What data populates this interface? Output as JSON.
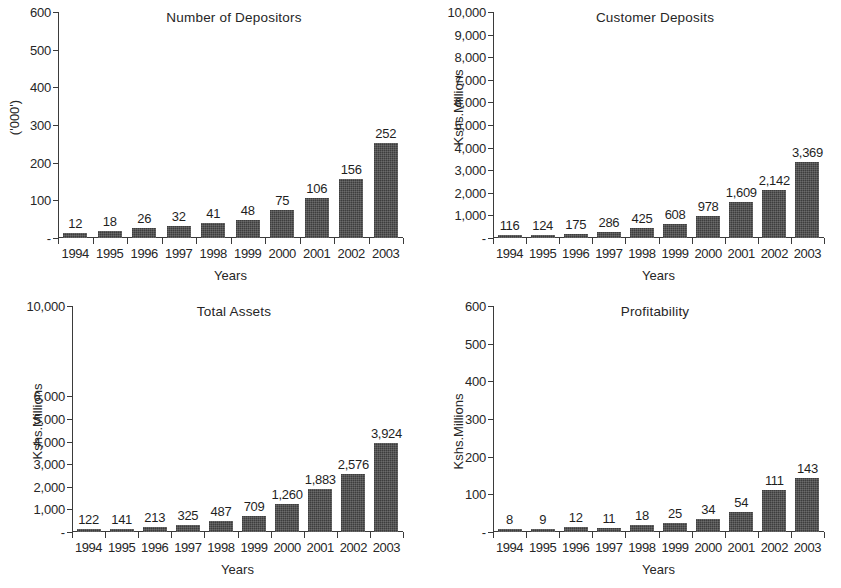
{
  "figure": {
    "background": "#ffffff",
    "bar_color": "#4a4a4a",
    "axis_color": "#3b3b3b",
    "panel_count": 4
  },
  "chart_data": [
    {
      "type": "bar",
      "title": "Number of Depositors",
      "xlabel": "Years",
      "ylabel": "('000')",
      "categories": [
        "1994",
        "1995",
        "1996",
        "1997",
        "1998",
        "1999",
        "2000",
        "2001",
        "2002",
        "2003"
      ],
      "values": [
        12,
        18,
        26,
        32,
        41,
        48,
        75,
        106,
        156,
        252
      ],
      "value_labels": [
        "12",
        "18",
        "26",
        "32",
        "41",
        "48",
        "75",
        "106",
        "156",
        "252"
      ],
      "ylim": [
        0,
        600
      ],
      "yticks": [
        0,
        100,
        200,
        300,
        400,
        500,
        600
      ],
      "ytick_labels": [
        "-",
        "100",
        "200",
        "300",
        "400",
        "500",
        "600"
      ],
      "grid": false,
      "legend": "none"
    },
    {
      "type": "bar",
      "title": "Customer Deposits",
      "xlabel": "Years",
      "ylabel": "Kshs.Millions",
      "categories": [
        "1994",
        "1995",
        "1996",
        "1997",
        "1998",
        "1999",
        "2000",
        "2001",
        "2002",
        "2003"
      ],
      "values": [
        116,
        124,
        175,
        286,
        425,
        608,
        978,
        1609,
        2142,
        3369
      ],
      "value_labels": [
        "116",
        "124",
        "175",
        "286",
        "425",
        "608",
        "978",
        "1,609",
        "2,142",
        "3,369"
      ],
      "ylim": [
        0,
        10000
      ],
      "yticks": [
        0,
        1000,
        2000,
        3000,
        4000,
        5000,
        6000,
        7000,
        8000,
        9000,
        10000
      ],
      "ytick_labels": [
        "-",
        "1,000",
        "2,000",
        "3,000",
        "4,000",
        "5,000",
        "6,000",
        "7,000",
        "8,000",
        "9,000",
        "10,000"
      ],
      "grid": false,
      "legend": "none"
    },
    {
      "type": "bar",
      "title": "Total Assets",
      "xlabel": "Years",
      "ylabel": "Kshs.Millions",
      "categories": [
        "1994",
        "1995",
        "1996",
        "1997",
        "1998",
        "1999",
        "2000",
        "2001",
        "2002",
        "2003"
      ],
      "values": [
        122,
        141,
        213,
        325,
        487,
        709,
        1260,
        1883,
        2576,
        3924
      ],
      "value_labels": [
        "122",
        "141",
        "213",
        "325",
        "487",
        "709",
        "1,260",
        "1,883",
        "2,576",
        "3,924"
      ],
      "ylim": [
        0,
        10000
      ],
      "yticks": [
        0,
        1000,
        2000,
        3000,
        4000,
        5000,
        6000,
        10000
      ],
      "ytick_labels": [
        "-",
        "1,000",
        "2,000",
        "3,000",
        "4,000",
        "5,000",
        "6,000",
        "10,000"
      ],
      "grid": false,
      "legend": "none",
      "note": "y-axis tick labels skip 7,000 / 8,000 / 9,000 as printed"
    },
    {
      "type": "bar",
      "title": "Profitability",
      "xlabel": "Years",
      "ylabel": "Kshs.Millions",
      "categories": [
        "1994",
        "1995",
        "1996",
        "1997",
        "1998",
        "1999",
        "2000",
        "2001",
        "2002",
        "2003"
      ],
      "values": [
        8,
        9,
        12,
        11,
        18,
        25,
        34,
        54,
        111,
        143
      ],
      "value_labels": [
        "8",
        "9",
        "12",
        "11",
        "18",
        "25",
        "34",
        "54",
        "111",
        "143"
      ],
      "ylim": [
        0,
        600
      ],
      "yticks": [
        0,
        100,
        200,
        300,
        400,
        500,
        600
      ],
      "ytick_labels": [
        "-",
        "100",
        "200",
        "300",
        "400",
        "500",
        "600"
      ],
      "grid": false,
      "legend": "none"
    }
  ]
}
